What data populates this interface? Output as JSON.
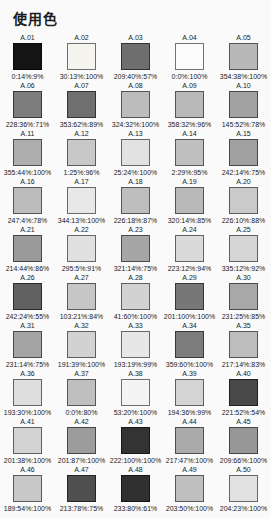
{
  "title": "使用色",
  "palette": {
    "swatches": [
      {
        "label": "A.01",
        "value": "0:14%:9%",
        "color": "#141414"
      },
      {
        "label": "A.02",
        "value": "30:13%:100%",
        "color": "#f5f4ef"
      },
      {
        "label": "A.03",
        "value": "209:40%:57%",
        "color": "#6e6e6e"
      },
      {
        "label": "A.04",
        "value": "0:0%:100%",
        "color": "#fcfcfc"
      },
      {
        "label": "A.05",
        "value": "354:38%:100%",
        "color": "#b8b8b8"
      },
      {
        "label": "A.06",
        "value": "228:36%:71%",
        "color": "#7d7d7d"
      },
      {
        "label": "A.07",
        "value": "353:62%:89%",
        "color": "#6f6f6f"
      },
      {
        "label": "A.08",
        "value": "324:32%:100%",
        "color": "#bcbcbc"
      },
      {
        "label": "A.09",
        "value": "358:32%:96%",
        "color": "#b9b9b9"
      },
      {
        "label": "A.10",
        "value": "145:52%:78%",
        "color": "#a2a2a2"
      },
      {
        "label": "A.11",
        "value": "355:44%:100%",
        "color": "#aeaeae"
      },
      {
        "label": "A.12",
        "value": "1:25%:96%",
        "color": "#c8c8c8"
      },
      {
        "label": "A.13",
        "value": "25:24%:100%",
        "color": "#e2e2e2"
      },
      {
        "label": "A.14",
        "value": "2:29%:95%",
        "color": "#c0c0c0"
      },
      {
        "label": "A.15",
        "value": "242:14%:75%",
        "color": "#a0a0a0"
      },
      {
        "label": "A.16",
        "value": "247:4%:78%",
        "color": "#bcbcbc"
      },
      {
        "label": "A.17",
        "value": "344:13%:100%",
        "color": "#e8e8e8"
      },
      {
        "label": "A.18",
        "value": "226:18%:87%",
        "color": "#bebebe"
      },
      {
        "label": "A.19",
        "value": "320:14%:85%",
        "color": "#b9b9b9"
      },
      {
        "label": "A.20",
        "value": "226:10%:88%",
        "color": "#cacaca"
      },
      {
        "label": "A.21",
        "value": "214:44%:86%",
        "color": "#9a9a9a"
      },
      {
        "label": "A.22",
        "value": "295:5%:91%",
        "color": "#e0e0e0"
      },
      {
        "label": "A.23",
        "value": "321:14%:75%",
        "color": "#a6a6a6"
      },
      {
        "label": "A.24",
        "value": "223:12%:94%",
        "color": "#dadada"
      },
      {
        "label": "A.25",
        "value": "335:12%:92%",
        "color": "#d6d6d6"
      },
      {
        "label": "A.26",
        "value": "242:24%:55%",
        "color": "#616161"
      },
      {
        "label": "A.27",
        "value": "103:21%:84%",
        "color": "#c6c6c6"
      },
      {
        "label": "A.28",
        "value": "41:60%:100%",
        "color": "#d2d2d2"
      },
      {
        "label": "A.29",
        "value": "201:100%:100%",
        "color": "#777777"
      },
      {
        "label": "A.30",
        "value": "231:25%:85%",
        "color": "#a8a8a8"
      },
      {
        "label": "A.31",
        "value": "231:14%:75%",
        "color": "#a4a4a4"
      },
      {
        "label": "A.32",
        "value": "191:39%:100%",
        "color": "#d2d2d2"
      },
      {
        "label": "A.33",
        "value": "193:19%:99%",
        "color": "#e7e7e7"
      },
      {
        "label": "A.34",
        "value": "359:60%:100%",
        "color": "#7c7c7c"
      },
      {
        "label": "A.35",
        "value": "217:14%:83%",
        "color": "#bdbdbd"
      },
      {
        "label": "A.36",
        "value": "193:30%:100%",
        "color": "#dedede"
      },
      {
        "label": "A.37",
        "value": "0:0%:80%",
        "color": "#bfbfbf"
      },
      {
        "label": "A.38",
        "value": "53:20%:100%",
        "color": "#f4f4f4"
      },
      {
        "label": "A.39",
        "value": "194:36%:99%",
        "color": "#d4d4d4"
      },
      {
        "label": "A.40",
        "value": "221:52%:54%",
        "color": "#484848"
      },
      {
        "label": "A.41",
        "value": "201:38%:100%",
        "color": "#d3d3d3"
      },
      {
        "label": "A.42",
        "value": "201:87%:100%",
        "color": "#9c9c9c"
      },
      {
        "label": "A.43",
        "value": "222:100%:100%",
        "color": "#333333"
      },
      {
        "label": "A.44",
        "value": "217:47%:100%",
        "color": "#ababab"
      },
      {
        "label": "A.45",
        "value": "209:66%:100%",
        "color": "#979797"
      },
      {
        "label": "A.46",
        "value": "189:54%:100%",
        "color": "#c8c8c8"
      },
      {
        "label": "A.47",
        "value": "213:78%:75%",
        "color": "#4f4f4f"
      },
      {
        "label": "A.48",
        "value": "233:80%:61%",
        "color": "#303030"
      },
      {
        "label": "A.49",
        "value": "203:50%:100%",
        "color": "#c0c0c0"
      },
      {
        "label": "A.50",
        "value": "204:23%:100%",
        "color": "#e2e2e2"
      }
    ]
  }
}
